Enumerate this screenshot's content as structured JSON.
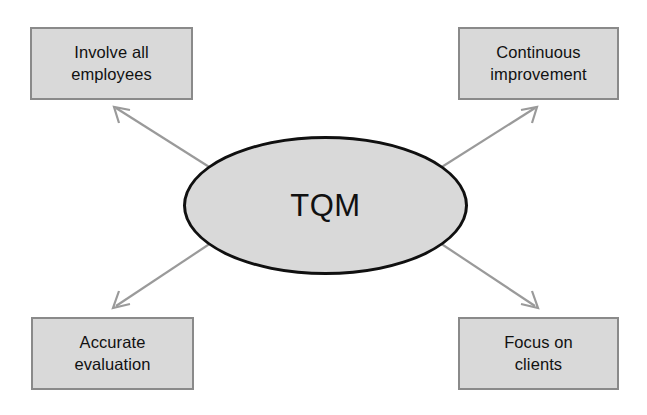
{
  "diagram": {
    "title": "TQM",
    "center": {
      "label": "TQM",
      "shape": "ellipse",
      "fill_color": "#d9d9d9",
      "border_color": "#101010"
    },
    "nodes": [
      {
        "id": "involve-all-employees",
        "label": "Involve all employees",
        "line1": "Involve all",
        "line2": "employees",
        "position": "top-left",
        "fill_color": "#d9d9d9",
        "border_color": "#8a8a8a"
      },
      {
        "id": "continuous-improvement",
        "label": "Continuous improvement",
        "line1": "Continuous",
        "line2": "improvement",
        "position": "top-right",
        "fill_color": "#d9d9d9",
        "border_color": "#8a8a8a"
      },
      {
        "id": "accurate-evaluation",
        "label": "Accurate evaluation",
        "line1": "Accurate",
        "line2": "evaluation",
        "position": "bottom-left",
        "fill_color": "#d9d9d9",
        "border_color": "#8a8a8a"
      },
      {
        "id": "focus-on-clients",
        "label": "Focus on clients",
        "line1": "Focus on",
        "line2": "clients",
        "position": "bottom-right",
        "fill_color": "#d9d9d9",
        "border_color": "#8a8a8a"
      }
    ],
    "connectors": [
      {
        "id": "arrow-to-involve-all-employees",
        "from": "TQM",
        "to": "Involve all employees",
        "direction": "up-left",
        "color": "#9a9a9a"
      },
      {
        "id": "arrow-to-continuous-improvement",
        "from": "TQM",
        "to": "Continuous improvement",
        "direction": "up-right",
        "color": "#9a9a9a"
      },
      {
        "id": "arrow-to-accurate-evaluation",
        "from": "TQM",
        "to": "Accurate evaluation",
        "direction": "down-left",
        "color": "#9a9a9a"
      },
      {
        "id": "arrow-to-focus-on-clients",
        "from": "TQM",
        "to": "Focus on clients",
        "direction": "down-right",
        "color": "#9a9a9a"
      }
    ],
    "background_color": "#ffffff"
  }
}
